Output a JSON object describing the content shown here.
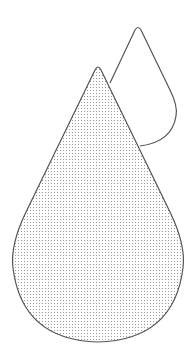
{
  "illustration": {
    "subject": "two water drops",
    "icons": [
      {
        "name": "water-drop-back-icon",
        "fill": "none",
        "stroke": "#555555"
      },
      {
        "name": "water-drop-front-icon",
        "fill": "dotted",
        "stroke": "#555555",
        "dot_color": "#9a9a9a"
      }
    ],
    "colors": {
      "background": "#ffffff",
      "stroke": "#555555",
      "dots": "#9a9a9a"
    }
  }
}
